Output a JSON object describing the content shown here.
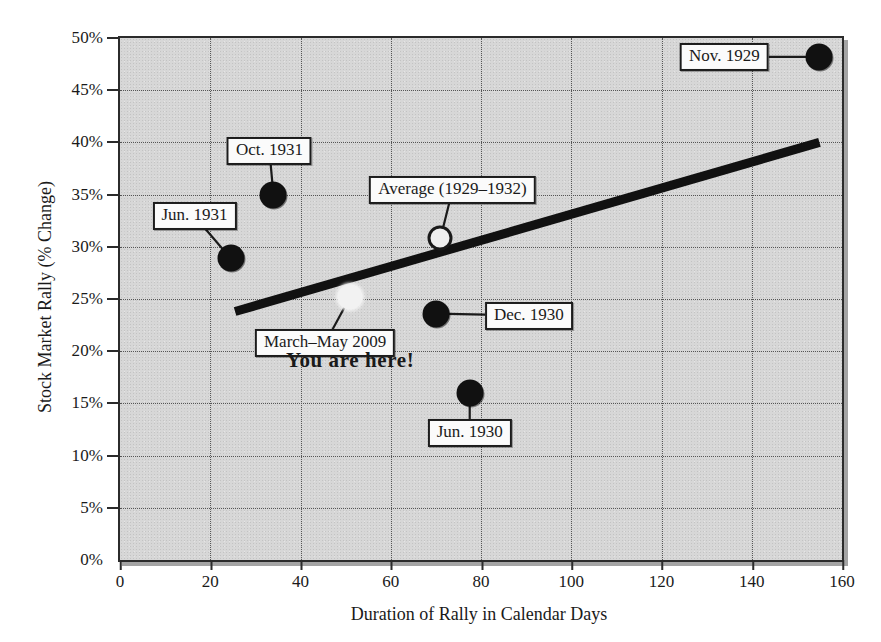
{
  "chart_data": {
    "type": "scatter",
    "title": "",
    "xlabel": "Duration of Rally in Calendar Days",
    "ylabel": "Stock Market Rally (% Change)",
    "xlim": [
      0,
      160
    ],
    "ylim": [
      0,
      50
    ],
    "xticks": [
      "0",
      "20",
      "40",
      "60",
      "80",
      "100",
      "120",
      "140",
      "160"
    ],
    "xtick_values": [
      0,
      20,
      40,
      60,
      80,
      100,
      120,
      140,
      160
    ],
    "yticks": [
      "0%",
      "5%",
      "10%",
      "15%",
      "20%",
      "25%",
      "30%",
      "35%",
      "40%",
      "45%",
      "50%"
    ],
    "ytick_values": [
      0,
      5,
      10,
      15,
      20,
      25,
      30,
      35,
      40,
      45,
      50
    ],
    "grid": true,
    "legend": "none",
    "points": [
      {
        "label": "Nov. 1929",
        "x": 155,
        "y": 48.2,
        "style": "filled",
        "label_dx": -95,
        "label_dy": 0
      },
      {
        "label": "Oct. 1931",
        "x": 34,
        "y": 35.0,
        "style": "filled",
        "label_dx": -4,
        "label_dy": -44
      },
      {
        "label": "Jun. 1931",
        "x": 24.5,
        "y": 28.9,
        "style": "filled",
        "label_dx": -36,
        "label_dy": -42
      },
      {
        "label": "Dec. 1930",
        "x": 70,
        "y": 23.6,
        "style": "filled",
        "label_dx": 93,
        "label_dy": 2
      },
      {
        "label": "Jun. 1930",
        "x": 77.5,
        "y": 16.0,
        "style": "filled",
        "label_dx": 0,
        "label_dy": 40
      },
      {
        "label": "Average (1929–1932)",
        "x": 71,
        "y": 30.8,
        "style": "hollow",
        "label_dx": 12,
        "label_dy": -48
      },
      {
        "label": "March–May 2009",
        "x": 51,
        "y": 25.2,
        "style": "light",
        "label_dx": -25,
        "label_dy": 46
      }
    ],
    "trendline": {
      "x0": 25.5,
      "y0": 23.8,
      "x1": 155,
      "y1": 40.0
    },
    "annotations": [
      {
        "text": "You are here!",
        "x": 51,
        "y": 19.2
      }
    ]
  },
  "a11y": {
    "figure_name": "stock-market-rally-scatter-chart"
  }
}
